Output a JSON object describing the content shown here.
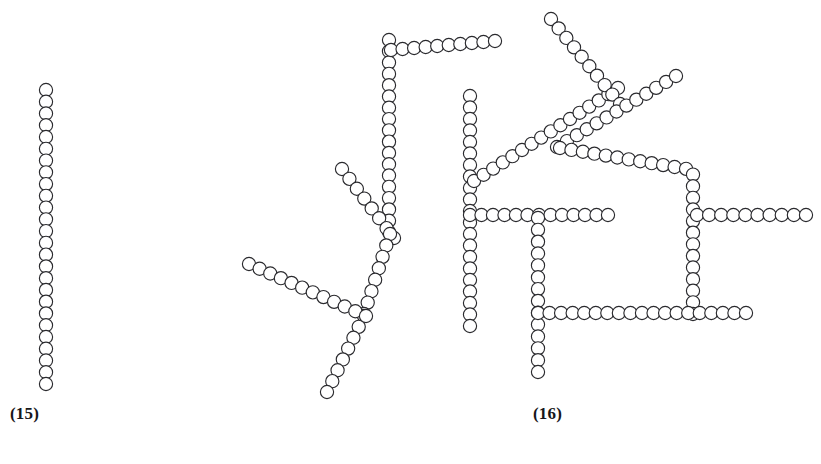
{
  "figure": {
    "background_color": "#ffffff",
    "bead_fill": "#ffffff",
    "bead_stroke": "#2a2a2e",
    "bead_radius": 6.6,
    "bead_spacing": 11.6,
    "panels": [
      {
        "id": "panel-15",
        "label": "(15)",
        "label_x": 10,
        "label_y": 404,
        "description": "linear unbranched chain"
      },
      {
        "id": "panel-16",
        "label": "(16)",
        "label_x": 533,
        "label_y": 404,
        "description": "branched cross-linked network chain"
      }
    ]
  },
  "chart_data": {
    "type": "scatter",
    "title": "",
    "xlabel": "",
    "ylabel": "",
    "xlim": [
      0,
      821
    ],
    "ylim": [
      464,
      0
    ],
    "grid": false,
    "legend": null,
    "annotations": [
      {
        "text": "(15)",
        "x": 10,
        "y": 404
      },
      {
        "text": "(16)",
        "x": 533,
        "y": 404
      }
    ],
    "marker": {
      "shape": "open-circle",
      "radius": 6.6,
      "facecolor": "#ffffff",
      "edgecolor": "#2a2a2e",
      "linewidth": 1.15
    },
    "series": [
      {
        "name": "chain-15-main",
        "panel": "panel-15",
        "polyline": [
          [
            46,
            90
          ],
          [
            46,
            384
          ]
        ]
      },
      {
        "name": "chain-16-a-vertical-left",
        "panel": "panel-16",
        "polyline": [
          [
            389,
            40
          ],
          [
            389,
            232
          ]
        ]
      },
      {
        "name": "chain-16-b-horizontal-top",
        "panel": "panel-16",
        "polyline": [
          [
            391,
            50
          ],
          [
            495,
            41
          ]
        ]
      },
      {
        "name": "chain-16-c-branch-upper-left",
        "panel": "panel-16",
        "polyline": [
          [
            342,
            169
          ],
          [
            394,
            238
          ]
        ]
      },
      {
        "name": "chain-16-d-diagonal-lower",
        "panel": "panel-16",
        "polyline": [
          [
            390,
            234
          ],
          [
            364,
            314
          ]
        ]
      },
      {
        "name": "chain-16-e-diagonal-tail",
        "panel": "panel-16",
        "polyline": [
          [
            364,
            316
          ],
          [
            327,
            392
          ]
        ]
      },
      {
        "name": "chain-16-f-diagonal-left-low",
        "panel": "panel-16",
        "polyline": [
          [
            249,
            264
          ],
          [
            366,
            316
          ]
        ]
      },
      {
        "name": "chain-16-g-vertical-mid",
        "panel": "panel-16",
        "polyline": [
          [
            470,
            96
          ],
          [
            470,
            326
          ]
        ]
      },
      {
        "name": "chain-16-h-diagonal-rising",
        "panel": "panel-16",
        "polyline": [
          [
            474,
            181
          ],
          [
            618,
            88
          ]
        ]
      },
      {
        "name": "chain-16-i-diagonal-top-right",
        "panel": "panel-16",
        "polyline": [
          [
            551,
            19
          ],
          [
            620,
            104
          ]
        ]
      },
      {
        "name": "chain-16-j-diagonal-up-right",
        "panel": "panel-16",
        "polyline": [
          [
            557,
            147
          ],
          [
            676,
            76
          ]
        ]
      },
      {
        "name": "chain-16-k-bend-to-vertical-right",
        "panel": "panel-16",
        "polyline": [
          [
            560,
            148
          ],
          [
            693,
            170
          ],
          [
            693,
            314
          ]
        ]
      },
      {
        "name": "chain-16-l-horizontal-mid",
        "panel": "panel-16",
        "polyline": [
          [
            470,
            215
          ],
          [
            608,
            215
          ]
        ]
      },
      {
        "name": "chain-16-m-horizontal-mid-right",
        "panel": "panel-16",
        "polyline": [
          [
            697,
            215
          ],
          [
            806,
            215
          ]
        ]
      },
      {
        "name": "chain-16-n-vertical-lower-mid",
        "panel": "panel-16",
        "polyline": [
          [
            538,
            218
          ],
          [
            538,
            372
          ]
        ]
      },
      {
        "name": "chain-16-o-horizontal-bottom",
        "panel": "panel-16",
        "polyline": [
          [
            538,
            313
          ],
          [
            746,
            313
          ]
        ]
      }
    ]
  }
}
